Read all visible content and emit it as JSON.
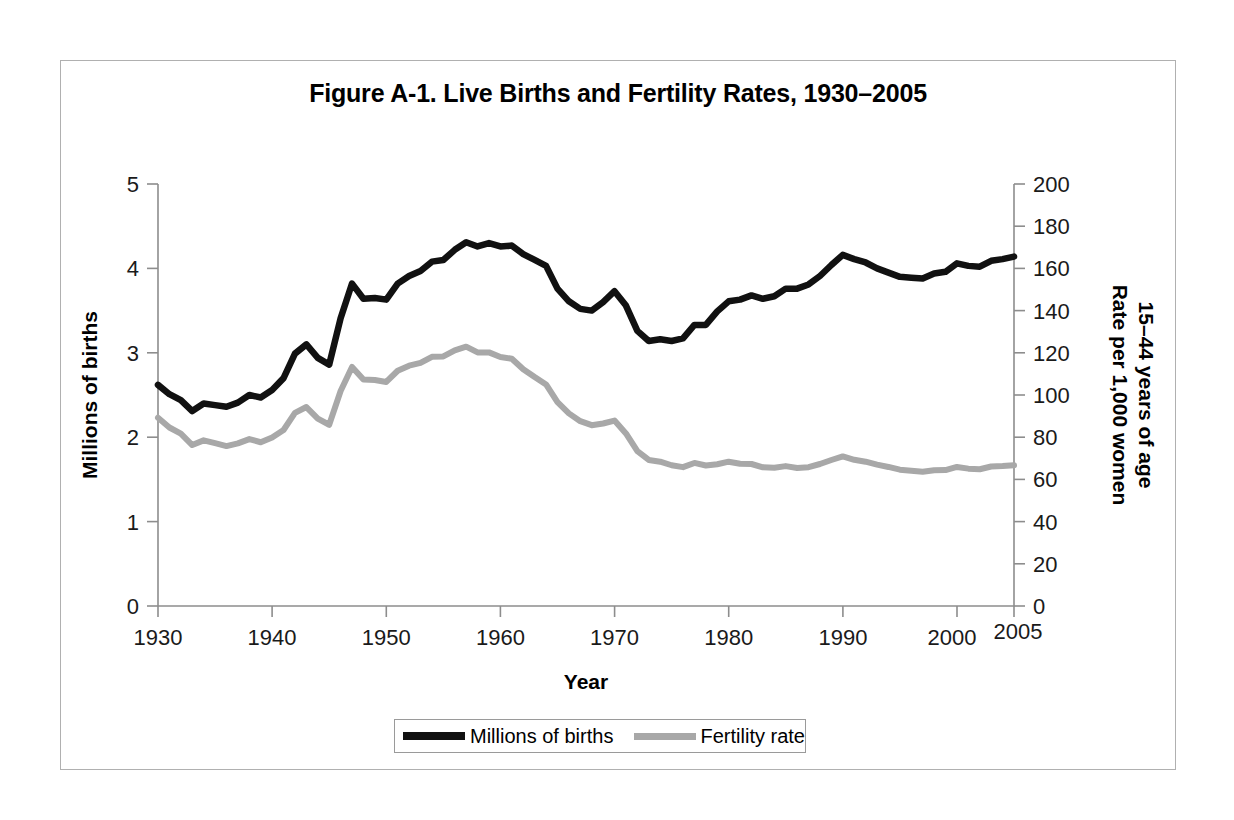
{
  "figure": {
    "title": "Figure A-1. Live Births and Fertility Rates, 1930–2005"
  },
  "axes": {
    "left_title": "Millions of births",
    "right_title_line1": "Rate per 1,000 women",
    "right_title_line2": "15–44 years of age",
    "x_title": "Year"
  },
  "legend": {
    "items": [
      {
        "label": "Millions of births",
        "color": "#111111",
        "swatch": "series-births"
      },
      {
        "label": "Fertility rate",
        "color": "#a8a8a8",
        "swatch": "series-fertility"
      }
    ]
  },
  "chart_data": {
    "type": "line",
    "title": "Figure A-1. Live Births and Fertility Rates, 1930–2005",
    "xlabel": "Year",
    "ylabel": "Millions of births",
    "y2label": "Rate per 1,000 women 15–44 years of age",
    "xlim": [
      1930,
      2005
    ],
    "ylim": [
      0,
      5
    ],
    "y2lim": [
      0,
      200
    ],
    "yticks": [
      0,
      1,
      2,
      3,
      4,
      5
    ],
    "y2ticks": [
      0,
      20,
      40,
      60,
      80,
      100,
      120,
      140,
      160,
      180,
      200
    ],
    "xticks": [
      1930,
      1940,
      1950,
      1960,
      1970,
      1980,
      1990,
      2000,
      2005
    ],
    "xtick_labels": [
      "1930",
      "1940",
      "1950",
      "1960",
      "1970",
      "1980",
      "1990",
      "2000",
      "2005"
    ],
    "grid": false,
    "legend_position": "bottom",
    "x": [
      1930,
      1931,
      1932,
      1933,
      1934,
      1935,
      1936,
      1937,
      1938,
      1939,
      1940,
      1941,
      1942,
      1943,
      1944,
      1945,
      1946,
      1947,
      1948,
      1949,
      1950,
      1951,
      1952,
      1953,
      1954,
      1955,
      1956,
      1957,
      1958,
      1959,
      1960,
      1961,
      1962,
      1963,
      1964,
      1965,
      1966,
      1967,
      1968,
      1969,
      1970,
      1971,
      1972,
      1973,
      1974,
      1975,
      1976,
      1977,
      1978,
      1979,
      1980,
      1981,
      1982,
      1983,
      1984,
      1985,
      1986,
      1987,
      1988,
      1989,
      1990,
      1991,
      1992,
      1993,
      1994,
      1995,
      1996,
      1997,
      1998,
      1999,
      2000,
      2001,
      2002,
      2003,
      2004,
      2005
    ],
    "series": [
      {
        "name": "Millions of births",
        "axis": "left",
        "color": "#111111",
        "units": "millions",
        "values": [
          2.62,
          2.51,
          2.44,
          2.31,
          2.4,
          2.38,
          2.36,
          2.41,
          2.5,
          2.47,
          2.56,
          2.7,
          2.99,
          3.1,
          2.94,
          2.86,
          3.41,
          3.82,
          3.64,
          3.65,
          3.63,
          3.82,
          3.91,
          3.97,
          4.08,
          4.1,
          4.22,
          4.31,
          4.26,
          4.3,
          4.26,
          4.27,
          4.17,
          4.1,
          4.03,
          3.76,
          3.61,
          3.52,
          3.5,
          3.6,
          3.73,
          3.56,
          3.26,
          3.14,
          3.16,
          3.14,
          3.17,
          3.33,
          3.33,
          3.49,
          3.61,
          3.63,
          3.68,
          3.64,
          3.67,
          3.76,
          3.76,
          3.81,
          3.91,
          4.04,
          4.16,
          4.11,
          4.07,
          4.0,
          3.95,
          3.9,
          3.89,
          3.88,
          3.94,
          3.96,
          4.06,
          4.03,
          4.02,
          4.09,
          4.11,
          4.14
        ]
      },
      {
        "name": "Fertility rate",
        "axis": "right",
        "color": "#a8a8a8",
        "units": "births per 1,000 women aged 15–44",
        "values": [
          89.2,
          84.6,
          81.7,
          76.3,
          78.5,
          77.2,
          75.8,
          77.1,
          79.1,
          77.6,
          79.9,
          83.4,
          91.5,
          94.3,
          88.8,
          85.9,
          101.9,
          113.3,
          107.3,
          107.1,
          106.2,
          111.5,
          113.9,
          115.2,
          118.1,
          118.3,
          121.2,
          122.9,
          120.2,
          120.2,
          118.0,
          117.2,
          112.2,
          108.5,
          105.0,
          96.6,
          91.3,
          87.6,
          85.7,
          86.5,
          87.9,
          81.8,
          73.4,
          69.2,
          68.4,
          66.7,
          65.8,
          67.8,
          66.6,
          67.2,
          68.4,
          67.4,
          67.3,
          65.7,
          65.5,
          66.3,
          65.4,
          65.8,
          67.3,
          69.2,
          70.9,
          69.3,
          68.4,
          67.0,
          65.9,
          64.6,
          64.1,
          63.6,
          64.3,
          64.4,
          65.9,
          65.1,
          64.8,
          66.1,
          66.3,
          66.7
        ]
      }
    ]
  }
}
